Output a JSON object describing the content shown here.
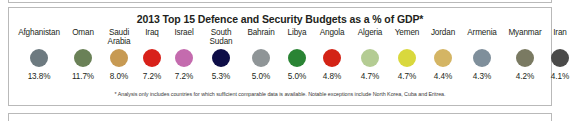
{
  "panel": {
    "title": "2013 Top 15 Defence and Security Budgets as a % of GDP*",
    "footnote": "* Analysis only includes countries for which sufficient comparable data is available. Notable exceptions include North Korea, Cuba and Eritrea."
  },
  "chart_data": {
    "type": "bar",
    "title": "2013 Top 15 Defence and Security Budgets as a % of GDP*",
    "xlabel": "",
    "ylabel": "% of GDP",
    "categories": [
      "Afghanistan",
      "Oman",
      "Saudi Arabia",
      "Iraq",
      "Israel",
      "South Sudan",
      "Bahrain",
      "Libya",
      "Angola",
      "Algeria",
      "Yemen",
      "Jordan",
      "Armenia",
      "Myanmar",
      "Iran"
    ],
    "values": [
      13.8,
      11.7,
      8.0,
      7.2,
      7.2,
      5.3,
      5.0,
      5.0,
      4.8,
      4.7,
      4.7,
      4.4,
      4.3,
      4.2,
      4.1
    ],
    "value_labels": [
      "13.8%",
      "11.7%",
      "8.0%",
      "7.2%",
      "7.2%",
      "5.3%",
      "5.0%",
      "5.0%",
      "4.8%",
      "4.7%",
      "4.7%",
      "4.4%",
      "4.3%",
      "4.2%",
      "4.1%"
    ],
    "marker_colors": [
      "#6d7a80",
      "#6a8157",
      "#c79a53",
      "#d8211a",
      "#c46bae",
      "#0e0d47",
      "#8f9597",
      "#2a8434",
      "#d32316",
      "#b4cc93",
      "#d9d83d",
      "#d4b564",
      "#7f8f9b",
      "#7a7a62",
      "#4a4a49"
    ],
    "legend": [],
    "grid": false,
    "series": [
      {
        "name": "Defence and Security Budget as % of GDP",
        "values": [
          13.8,
          11.7,
          8.0,
          7.2,
          7.2,
          5.3,
          5.0,
          5.0,
          4.8,
          4.7,
          4.7,
          4.4,
          4.3,
          4.2,
          4.1
        ]
      }
    ]
  }
}
